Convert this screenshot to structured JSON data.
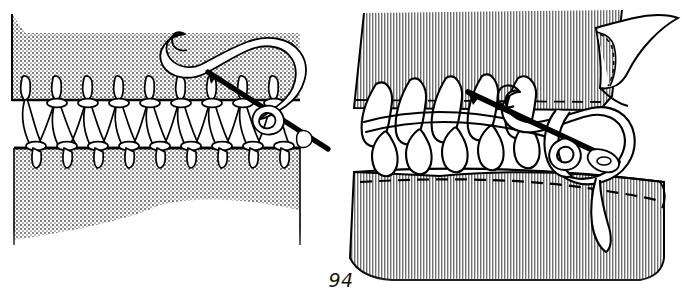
{
  "page": {
    "number": "94",
    "background_color": "#ffffff",
    "ink_color": "#000000",
    "width": 682,
    "height": 298
  },
  "figure": {
    "panel_count": 2,
    "panels": [
      {
        "id": "left-panel",
        "name": "faggoting-insertion-stitch",
        "caption": "",
        "fabric_fill_pattern": "fine-dot-halftone",
        "fabric_fill_color": "#d8d8d8",
        "pieces": [
          {
            "name": "upper-fabric-panel",
            "edge": "straight-horizontal"
          },
          {
            "name": "lower-fabric-panel",
            "edge": "straight-horizontal",
            "bottom": "wavy-fade"
          }
        ],
        "stitch": {
          "name": "faggoting-stitch-band",
          "repeat_count": 7,
          "knot_count_upper": 8,
          "knot_count_lower": 7
        },
        "needle": {
          "name": "threaded-needle",
          "orientation": "diagonal-upper-left-to-lower-right",
          "thread_loop": "large-open-loop"
        }
      },
      {
        "id": "right-panel",
        "name": "blanket-buttonhole-edge-stitch",
        "caption": "",
        "fabric_fill_pattern": "vertical-line-hatch",
        "fabric_fill_color": "#b9b9b9",
        "pieces": [
          {
            "name": "upper-fabric-panel",
            "edge": "dashed-stitch-line",
            "corner": "folded-back-flap"
          },
          {
            "name": "lower-fabric-panel",
            "edge": "dashed-stitch-line",
            "bottom": "wavy-fade"
          }
        ],
        "stitch": {
          "name": "looped-insertion-stitch-band",
          "loop_count": 5,
          "thread_weight": "thick"
        },
        "needle": {
          "name": "threaded-needle",
          "orientation": "diagonal-upper-left-to-lower-right",
          "thread_loop": "large-open-loop",
          "eye": "visible-at-lower-right"
        }
      }
    ]
  },
  "colors": {
    "outline": "#000000",
    "thread_fill": "#ffffff",
    "needle_fill": "#1a1a1a",
    "left_fabric": "#d9d9d9",
    "right_fabric": "#bcbcbc",
    "page_text": "#111111"
  }
}
